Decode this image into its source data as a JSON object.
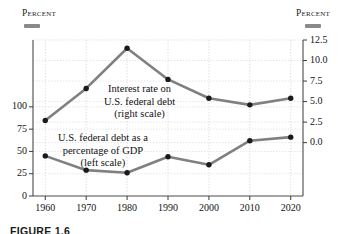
{
  "header": {
    "left_label": "Percent",
    "right_label": "Percent",
    "left_swatch_color": "#8a8a8a",
    "right_swatch_color": "#8a8a8a"
  },
  "caption": "FIGURE 1.6",
  "annotations": {
    "interest": {
      "line1": "Interest rate on",
      "line2": "U.S. federal debt",
      "line3": "(right scale)"
    },
    "debt": {
      "line1": "U.S. federal debt as a",
      "line2": "percentage of GDP",
      "line3": "(left scale)"
    }
  },
  "chart_data": {
    "type": "line",
    "title": "",
    "xlabel": "",
    "ylabel": "Percent",
    "grid": true,
    "legend_position": "inline-annotation",
    "x": [
      1960,
      1970,
      1980,
      1990,
      2000,
      2010,
      2020
    ],
    "xtick_labels": [
      "1960",
      "1970",
      "1980",
      "1990",
      "2000",
      "2010",
      "2020"
    ],
    "xlim": [
      1957,
      2023
    ],
    "left_axis": {
      "label": "Percent",
      "ylim": [
        0,
        175
      ],
      "ticks": [
        0,
        25,
        50,
        75,
        100
      ],
      "tick_labels": [
        "0",
        "25",
        "50",
        "75",
        "100"
      ]
    },
    "right_axis": {
      "label": "Percent",
      "ylim": [
        -6.5,
        12.5
      ],
      "ticks": [
        0.0,
        2.5,
        5.0,
        7.5,
        10.0,
        12.5
      ],
      "tick_labels": [
        "0.0",
        "2.5",
        "5.0",
        "7.5",
        "10.0",
        "12.5"
      ]
    },
    "series": [
      {
        "name": "Interest rate on U.S. federal debt",
        "axis": "right",
        "color": "#808080",
        "marker_color": "#1a1a1a",
        "values": [
          2.7,
          6.6,
          11.5,
          7.7,
          5.4,
          4.6,
          5.4
        ]
      },
      {
        "name": "U.S. federal debt as a percentage of GDP",
        "axis": "left",
        "color": "#808080",
        "marker_color": "#1a1a1a",
        "values": [
          45,
          29,
          26,
          44,
          35,
          62,
          66
        ]
      }
    ]
  }
}
